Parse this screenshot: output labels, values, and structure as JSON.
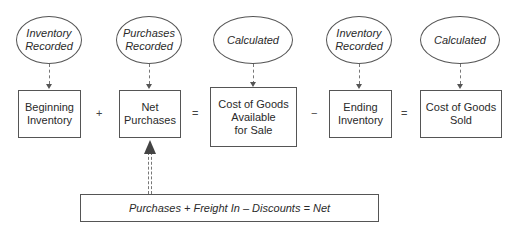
{
  "diagram": {
    "ellipses": [
      {
        "label": "Inventory\nRecorded"
      },
      {
        "label": "Purchases\nRecorded"
      },
      {
        "label": "Calculated"
      },
      {
        "label": "Inventory\nRecorded"
      },
      {
        "label": "Calculated"
      }
    ],
    "boxes": [
      {
        "label": "Beginning\nInventory"
      },
      {
        "label": "Net\nPurchases"
      },
      {
        "label": "Cost of Goods\nAvailable\nfor Sale"
      },
      {
        "label": "Ending\nInventory"
      },
      {
        "label": "Cost of Goods\nSold"
      }
    ],
    "operators": [
      "+",
      "=",
      "−",
      "="
    ],
    "formula": "Purchases + Freight In – Discounts = Net"
  }
}
